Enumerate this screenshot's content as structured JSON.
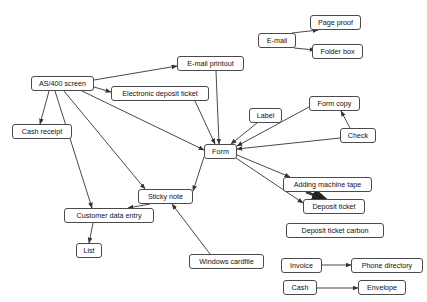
{
  "diagram": {
    "background_color": "#ffffff",
    "node_border_color": "#4a4a4a",
    "edge_color": "#333333",
    "nodes": [
      {
        "id": "as400",
        "label": "AS/400 screen",
        "x": 31,
        "y": 76,
        "w": 63,
        "h": 15
      },
      {
        "id": "cash_receipt",
        "label": "Cash receipt",
        "x": 12,
        "y": 124,
        "w": 60,
        "h": 15
      },
      {
        "id": "edt",
        "label": "Electronic deposit ticket",
        "x": 111,
        "y": 86,
        "w": 98,
        "h": 15
      },
      {
        "id": "email_print",
        "label": "E-mail printout",
        "x": 177,
        "y": 56,
        "w": 67,
        "h": 15
      },
      {
        "id": "email",
        "label": "E-mail",
        "x": 258,
        "y": 33,
        "w": 38,
        "h": 15
      },
      {
        "id": "page_proof",
        "label": "Page proof",
        "x": 310,
        "y": 15,
        "w": 51,
        "h": 15
      },
      {
        "id": "folder_box",
        "label": "Folder box",
        "x": 312,
        "y": 44,
        "w": 51,
        "h": 15
      },
      {
        "id": "label",
        "label": "Label",
        "x": 249,
        "y": 108,
        "w": 33,
        "h": 15
      },
      {
        "id": "form_copy",
        "label": "Form copy",
        "x": 309,
        "y": 96,
        "w": 51,
        "h": 15
      },
      {
        "id": "check",
        "label": "Check",
        "x": 340,
        "y": 128,
        "w": 36,
        "h": 15
      },
      {
        "id": "form",
        "label": "Form",
        "x": 204,
        "y": 144,
        "w": 33,
        "h": 15
      },
      {
        "id": "sticky_note",
        "label": "Sticky note",
        "x": 138,
        "y": 189,
        "w": 55,
        "h": 15
      },
      {
        "id": "adding_tape",
        "label": "Adding machine tape",
        "x": 283,
        "y": 177,
        "w": 89,
        "h": 15
      },
      {
        "id": "deposit_tkt",
        "label": "Deposit ticket",
        "x": 303,
        "y": 199,
        "w": 62,
        "h": 15
      },
      {
        "id": "dtc",
        "label": "Deposit ticket carbon",
        "x": 286,
        "y": 223,
        "w": 98,
        "h": 15
      },
      {
        "id": "cust_entry",
        "label": "Customer data entry",
        "x": 64,
        "y": 208,
        "w": 90,
        "h": 15
      },
      {
        "id": "list",
        "label": "List",
        "x": 76,
        "y": 243,
        "w": 26,
        "h": 15
      },
      {
        "id": "win_cardfile",
        "label": "Windows cardfile",
        "x": 189,
        "y": 254,
        "w": 75,
        "h": 15
      },
      {
        "id": "invoice",
        "label": "Invoice",
        "x": 281,
        "y": 258,
        "w": 41,
        "h": 15
      },
      {
        "id": "phone_dir",
        "label": "Phone directory",
        "x": 351,
        "y": 258,
        "w": 72,
        "h": 15
      },
      {
        "id": "cash",
        "label": "Cash",
        "x": 283,
        "y": 280,
        "w": 34,
        "h": 15
      },
      {
        "id": "envelope",
        "label": "Envelope",
        "x": 358,
        "y": 280,
        "w": 48,
        "h": 15
      }
    ],
    "edges": [
      {
        "from": "as400",
        "to": "email_print",
        "d": "M 94 80 L 177 66"
      },
      {
        "from": "as400",
        "to": "edt",
        "d": "M 94 87 L 111 92"
      },
      {
        "from": "as400",
        "to": "cash_receipt",
        "d": "M 49 91 L 40 124"
      },
      {
        "from": "as400",
        "to": "form",
        "d": "M 82 91 L 204 150"
      },
      {
        "from": "as400",
        "to": "sticky_note",
        "d": "M 64 91 L 145 189"
      },
      {
        "from": "as400",
        "to": "cust_entry",
        "d": "M 55 91 L 92 208"
      },
      {
        "from": "email",
        "to": "page_proof",
        "d": "M 292 33 L 318 30"
      },
      {
        "from": "email",
        "to": "folder_box",
        "d": "M 294 48 L 315 50"
      },
      {
        "from": "email_print",
        "to": "form",
        "d": "M 216 71 L 219 144"
      },
      {
        "from": "edt",
        "to": "form",
        "d": "M 195 101 L 215 144"
      },
      {
        "from": "label",
        "to": "form",
        "d": "M 257 123 L 231 144"
      },
      {
        "from": "form_copy",
        "to": "form",
        "d": "M 309 107 L 237 146"
      },
      {
        "from": "check",
        "to": "form_copy",
        "d": "M 350 128 L 341 111"
      },
      {
        "from": "check",
        "to": "form",
        "d": "M 340 138 L 237 149"
      },
      {
        "from": "form",
        "to": "sticky_note",
        "d": "M 204 157 L 193 191"
      },
      {
        "from": "form",
        "to": "adding_tape",
        "d": "M 237 155 L 290 177"
      },
      {
        "from": "form",
        "to": "deposit_tkt",
        "d": "M 236 158 L 303 203"
      },
      {
        "from": "adding_tape",
        "to": "deposit_tkt",
        "d": "M 306 192 L 325 199",
        "weight": "thick"
      },
      {
        "from": "sticky_note",
        "to": "cust_entry",
        "d": "M 150 204 L 128 208"
      },
      {
        "from": "cust_entry",
        "to": "list",
        "d": "M 93 223 L 89 243"
      },
      {
        "from": "win_cardfile",
        "to": "sticky_note",
        "d": "M 210 254 L 172 204"
      },
      {
        "from": "invoice",
        "to": "phone_dir",
        "d": "M 322 265 L 351 265"
      },
      {
        "from": "cash",
        "to": "envelope",
        "d": "M 317 288 L 358 288"
      }
    ]
  }
}
